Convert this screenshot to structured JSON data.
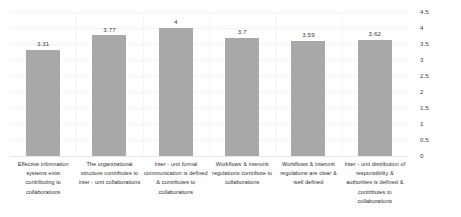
{
  "chart_data": {
    "type": "bar",
    "title": "",
    "subtitle": "",
    "xlabel": "",
    "ylabel": "",
    "ylim": [
      0,
      4.5
    ],
    "grid": true,
    "legend": "none",
    "orientation": "vertical",
    "value_axis_position": "right",
    "bar_color": "#a8a8a8",
    "categories": [
      "Effective information systems exist contributing to collaborations",
      "The organizational structure contributes to inter - unit collaborations",
      "Inter - unit formal communication is defined & contributes to collaborations",
      "Workflows & interunit regulations contribute to collaborations",
      "Workflows & interunit regulations are clear & well defined",
      "Inter - unit distribution of responsibility & authorities is defined & contributes to collaborations"
    ],
    "values": [
      3.31,
      3.77,
      4,
      3.7,
      3.59,
      3.62
    ],
    "value_labels": [
      "3.31",
      "3.77",
      "4",
      "3.7",
      "3.59",
      "3.62"
    ],
    "yticks": [
      4.5,
      4,
      3.5,
      3,
      2.5,
      2,
      1.5,
      1,
      0.5,
      0
    ],
    "ytick_labels": [
      "4.5",
      "4",
      "3.5",
      "3",
      "2.5",
      "2",
      "1.5",
      "1",
      "0.5",
      "0"
    ]
  }
}
